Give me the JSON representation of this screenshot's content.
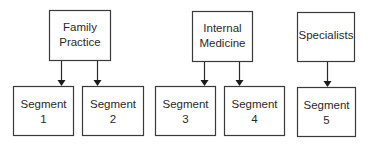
{
  "diagram": {
    "type": "hierarchy",
    "groups": [
      {
        "id": "family-practice",
        "label_lines": [
          "Family",
          "Practice"
        ],
        "children": [
          {
            "id": "segment-1",
            "label_lines": [
              "Segment",
              "1"
            ]
          },
          {
            "id": "segment-2",
            "label_lines": [
              "Segment",
              "2"
            ]
          }
        ]
      },
      {
        "id": "internal-medicine",
        "label_lines": [
          "Internal",
          "Medicine"
        ],
        "children": [
          {
            "id": "segment-3",
            "label_lines": [
              "Segment",
              "3"
            ]
          },
          {
            "id": "segment-4",
            "label_lines": [
              "Segment",
              "4"
            ]
          }
        ]
      },
      {
        "id": "specialists",
        "label_lines": [
          "Specialists"
        ],
        "children": [
          {
            "id": "segment-5",
            "label_lines": [
              "Segment",
              "5"
            ]
          }
        ]
      }
    ],
    "edges": [
      {
        "from": "family-practice",
        "to": "segment-1"
      },
      {
        "from": "family-practice",
        "to": "segment-2"
      },
      {
        "from": "internal-medicine",
        "to": "segment-3"
      },
      {
        "from": "internal-medicine",
        "to": "segment-4"
      },
      {
        "from": "specialists",
        "to": "segment-5"
      }
    ]
  }
}
